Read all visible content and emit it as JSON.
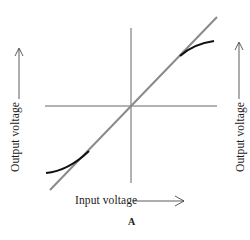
{
  "figure": {
    "caption": "A",
    "x_axis_label": "Input voltage",
    "y_axis_label_left": "Output voltage",
    "y_axis_label_right": "Output voltage",
    "colors": {
      "axes": "#555555",
      "ideal_line": "#8a8a8a",
      "curve": "#111111",
      "text": "#1a1a1a"
    }
  },
  "diagram": {
    "elements": [
      {
        "id": "horizontal-axis",
        "type": "line",
        "description": "Input voltage axis"
      },
      {
        "id": "vertical-axis",
        "type": "line",
        "description": "Output voltage axis"
      },
      {
        "id": "linear-transfer-line",
        "type": "line",
        "description": "Ideal linear transfer characteristic (gray diagonal)"
      },
      {
        "id": "upper-saturation-curve",
        "type": "curve",
        "description": "Output flattens at high positive input"
      },
      {
        "id": "lower-saturation-curve",
        "type": "curve",
        "description": "Output flattens at high negative input"
      }
    ]
  }
}
